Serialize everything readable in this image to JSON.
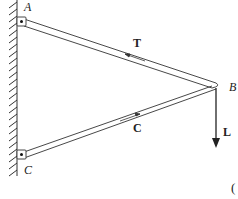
{
  "diagram": {
    "points": {
      "A": {
        "label": "A",
        "x": 21,
        "y": 22
      },
      "B": {
        "label": "B",
        "x": 216,
        "y": 86
      },
      "C": {
        "label": "C",
        "x": 21,
        "y": 155
      }
    },
    "members": [
      {
        "name": "AB",
        "force_label": "T",
        "type": "tension"
      },
      {
        "name": "CB",
        "force_label": "C",
        "type": "compression"
      }
    ],
    "load": {
      "label": "L",
      "direction": "down"
    },
    "partial_text": "(",
    "colors": {
      "line": "#333333",
      "background": "#ffffff"
    }
  }
}
